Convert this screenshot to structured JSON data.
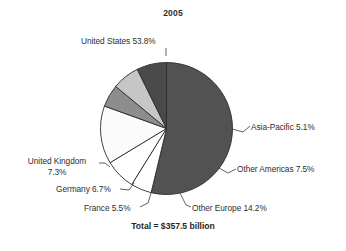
{
  "chart_data": {
    "type": "pie",
    "title": "2005",
    "total_label": "Total = $357.5 billion",
    "unit": "percent",
    "start_angle_deg": 0,
    "direction": "clockwise",
    "categories": [
      "United States",
      "Asia-Pacific",
      "Other Americas",
      "Other Europe",
      "France",
      "Germany",
      "United Kingdom"
    ],
    "values": [
      53.8,
      5.1,
      7.5,
      14.2,
      5.5,
      6.7,
      7.3
    ],
    "colors": [
      "#525252",
      "#ffffff",
      "#ffffff",
      "#fbfbfb",
      "#8d8d8d",
      "#c6c6c6",
      "#4a4a4a"
    ],
    "slices": [
      {
        "label": "United States",
        "value": 53.8,
        "text": "United States 53.8%",
        "color": "#525252"
      },
      {
        "label": "Asia-Pacific",
        "value": 5.1,
        "text": "Asia-Pacific 5.1%",
        "color": "#ffffff"
      },
      {
        "label": "Other Americas",
        "value": 7.5,
        "text": "Other Americas 7.5%",
        "color": "#ffffff"
      },
      {
        "label": "Other Europe",
        "value": 14.2,
        "text": "Other Europe 14.2%",
        "color": "#fbfbfb"
      },
      {
        "label": "France",
        "value": 5.5,
        "text": "France 5.5%",
        "color": "#8d8d8d"
      },
      {
        "label": "Germany",
        "value": 6.7,
        "text": "Germany 6.7%",
        "color": "#c6c6c6"
      },
      {
        "label": "United Kingdom",
        "value": 7.3,
        "text": "United Kingdom\n7.3%",
        "color": "#4a4a4a"
      }
    ],
    "legend": "none",
    "grid": false,
    "xlabel": "",
    "ylabel": ""
  },
  "labels": {
    "united_states": "United States 53.8%",
    "asia_pacific": "Asia-Pacific 5.1%",
    "other_americas": "Other Americas 7.5%",
    "other_europe": "Other Europe 14.2%",
    "france": "France 5.5%",
    "germany": "Germany 6.7%",
    "united_kingdom_line1": "United Kingdom",
    "united_kingdom_line2": "7.3%"
  }
}
